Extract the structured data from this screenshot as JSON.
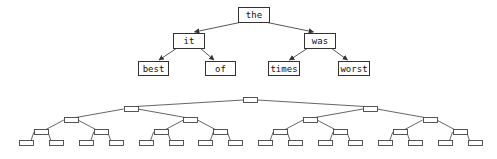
{
  "diagram": {
    "title": "",
    "word_tree": {
      "description": "Binary tree of words",
      "nodes": [
        {
          "id": "n0",
          "label": "the",
          "x": 238,
          "y": 7,
          "w": 31,
          "h": 15,
          "parent": null
        },
        {
          "id": "n1",
          "label": "it",
          "x": 173,
          "y": 33,
          "w": 31,
          "h": 15,
          "parent": "n0"
        },
        {
          "id": "n2",
          "label": "was",
          "x": 304,
          "y": 33,
          "w": 31,
          "h": 15,
          "parent": "n0"
        },
        {
          "id": "n3",
          "label": "best",
          "x": 138,
          "y": 61,
          "w": 30,
          "h": 14,
          "parent": "n1"
        },
        {
          "id": "n4",
          "label": "of",
          "x": 205,
          "y": 61,
          "w": 30,
          "h": 14,
          "parent": "n1"
        },
        {
          "id": "n5",
          "label": "times",
          "x": 268,
          "y": 61,
          "w": 31,
          "h": 14,
          "parent": "n2"
        },
        {
          "id": "n6",
          "label": "worst",
          "x": 338,
          "y": 61,
          "w": 31,
          "h": 14,
          "parent": "n2"
        }
      ]
    },
    "full_tree": {
      "description": "Complete binary tree, empty nodes",
      "levels": 5,
      "node_width": 14,
      "node_height": 5,
      "level_y": [
        97,
        106,
        117,
        129,
        140
      ],
      "leaf_first_center_x": 26,
      "leaf_spacing": 29.9
    }
  }
}
